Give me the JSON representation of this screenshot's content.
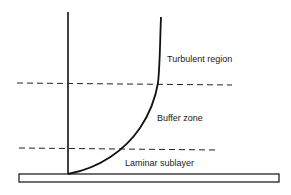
{
  "diagram": {
    "regions": [
      {
        "id": "turbulent",
        "label": "Turbulent region"
      },
      {
        "id": "buffer",
        "label": "Buffer zone"
      },
      {
        "id": "laminar",
        "label": "Laminar sublayer"
      }
    ],
    "colors": {
      "stroke": "#111111",
      "background": "#ffffff"
    }
  }
}
